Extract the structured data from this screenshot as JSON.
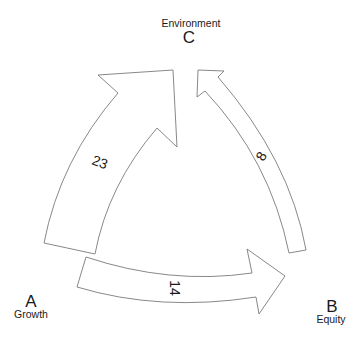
{
  "nodes": {
    "A": {
      "letter": "A",
      "name": "Growth"
    },
    "B": {
      "letter": "B",
      "name": "Equity"
    },
    "C": {
      "letter": "C",
      "name": "Environment"
    }
  },
  "flows": [
    {
      "from": "A",
      "to": "C",
      "value": "23"
    },
    {
      "from": "B",
      "to": "C",
      "value": "8"
    },
    {
      "from": "A",
      "to": "B",
      "value": "14"
    }
  ],
  "colors": {
    "arrow_fill": "#ffffff",
    "arrow_stroke": "#7a7a7a",
    "text": "#1a1a1a"
  }
}
